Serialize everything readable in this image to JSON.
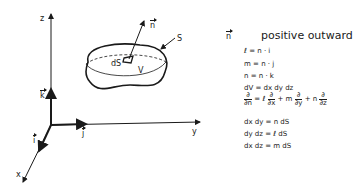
{
  "diagram": {
    "axes": {
      "x_label": "x",
      "y_label": "y",
      "z_label": "z"
    },
    "unit_vectors": {
      "i": "i",
      "j": "j",
      "k": "k"
    },
    "body": {
      "surface_label": "S",
      "volume_label": "V",
      "element_label": "dS",
      "normal_label": "n"
    }
  },
  "legend": {
    "normal_symbol": "n",
    "title": "positive outward",
    "equations": [
      {
        "lhs": "ℓ",
        "rhs": "= n · i"
      },
      {
        "lhs": "m",
        "rhs": "= n · j"
      },
      {
        "lhs": "n",
        "rhs": "= n · k"
      },
      {
        "text": "dV = dx dy dz"
      },
      {
        "text": "dx dy = n dS"
      },
      {
        "text": "dy dz = ℓ dS"
      },
      {
        "text": "dx dz = m dS"
      }
    ],
    "derivative": {
      "lhs_num": "∂",
      "lhs_den": "∂n",
      "t1_coef": "= ℓ",
      "t1_num": "∂",
      "t1_den": "∂x",
      "t2_coef": "+ m",
      "t2_num": "∂",
      "t2_den": "∂y",
      "t3_coef": "+ n",
      "t3_num": "∂",
      "t3_den": "∂z"
    }
  }
}
